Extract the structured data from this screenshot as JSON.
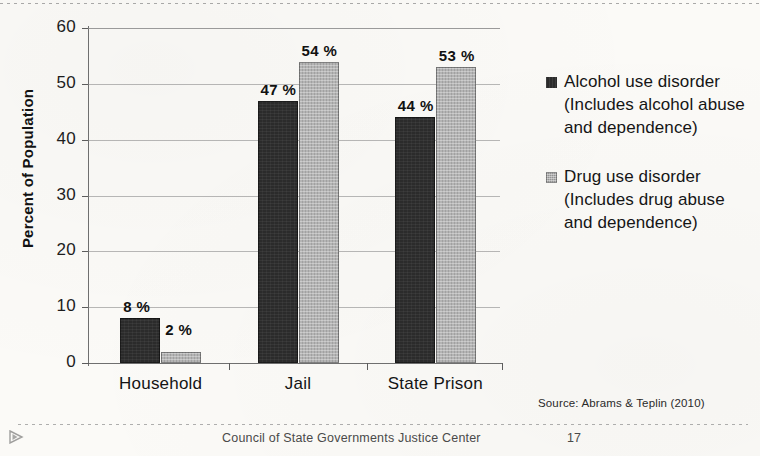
{
  "chart_data": {
    "type": "bar",
    "title": "",
    "xlabel": "",
    "ylabel": "Percent of Population",
    "ylim": [
      0,
      60
    ],
    "yticks": [
      0,
      10,
      20,
      30,
      40,
      50,
      60
    ],
    "ytick_labels": [
      "0",
      "10",
      "20",
      "30",
      "40",
      "50",
      "60"
    ],
    "grid": true,
    "legend_position": "right",
    "categories": [
      "Household",
      "Jail",
      "State Prison"
    ],
    "series": [
      {
        "name": "Alcohol use disorder (Includes alcohol abuse and dependence)",
        "short_name": "Alcohol use disorder",
        "color": "#2b2b2b",
        "values": [
          8,
          47,
          44
        ],
        "data_labels": [
          "8 %",
          "47 %",
          "44 %"
        ]
      },
      {
        "name": "Drug use disorder (Includes drug abuse and dependence)",
        "short_name": "Drug use disorder",
        "color": "#b4b4b4",
        "values": [
          2,
          54,
          53
        ],
        "data_labels": [
          "2 %",
          "54 %",
          "53 %"
        ]
      }
    ],
    "source": "Source: Abrams & Teplin (2010)"
  },
  "axis": {
    "y_title": "Percent of Population",
    "ticks": [
      {
        "label": "60",
        "value": 60
      },
      {
        "label": "50",
        "value": 50
      },
      {
        "label": "40",
        "value": 40
      },
      {
        "label": "30",
        "value": 30
      },
      {
        "label": "20",
        "value": 20
      },
      {
        "label": "10",
        "value": 10
      },
      {
        "label": "0",
        "value": 0
      }
    ],
    "categories": [
      {
        "label": "Household"
      },
      {
        "label": "Jail"
      },
      {
        "label": "State Prison"
      }
    ]
  },
  "bars": [
    {
      "group": "Household",
      "series": "alcohol",
      "value": 8,
      "label": "8 %"
    },
    {
      "group": "Household",
      "series": "drug",
      "value": 2,
      "label": "2 %"
    },
    {
      "group": "Jail",
      "series": "alcohol",
      "value": 47,
      "label": "47 %"
    },
    {
      "group": "Jail",
      "series": "drug",
      "value": 54,
      "label": "54 %"
    },
    {
      "group": "State Prison",
      "series": "alcohol",
      "value": 44,
      "label": "44 %"
    },
    {
      "group": "State Prison",
      "series": "drug",
      "value": 53,
      "label": "53 %"
    }
  ],
  "legend": {
    "entries": [
      {
        "swatch": "dark",
        "color": "#2b2b2b",
        "text": "Alcohol use disorder (Includes alcohol abuse and dependence)"
      },
      {
        "swatch": "light",
        "color": "#b4b4b4",
        "text": "Drug use disorder (Includes drug abuse and dependence)"
      }
    ]
  },
  "notes": {
    "source": "Source: Abrams & Teplin (2010)",
    "footer_org": "Council of State Governments Justice Center",
    "footer_page": "17"
  }
}
